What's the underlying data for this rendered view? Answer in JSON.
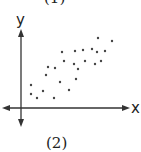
{
  "labels": {
    "top": "(1)",
    "bottom": "(2)"
  },
  "chart_data": {
    "type": "scatter",
    "title": "",
    "xlabel": "x",
    "ylabel": "y",
    "grid": false,
    "legend": null,
    "trend": "positive correlation",
    "points_px": [
      [
        98,
        38
      ],
      [
        112,
        41
      ],
      [
        62,
        52
      ],
      [
        75,
        51
      ],
      [
        83,
        50
      ],
      [
        92,
        49
      ],
      [
        97,
        52
      ],
      [
        105,
        51
      ],
      [
        64,
        61
      ],
      [
        74,
        64
      ],
      [
        78,
        69
      ],
      [
        85,
        61
      ],
      [
        95,
        64
      ],
      [
        101,
        61
      ],
      [
        48,
        67
      ],
      [
        55,
        68
      ],
      [
        46,
        75
      ],
      [
        60,
        82
      ],
      [
        76,
        79
      ],
      [
        31,
        85
      ],
      [
        43,
        91
      ],
      [
        69,
        90
      ],
      [
        31,
        94
      ],
      [
        37,
        98
      ],
      [
        54,
        98
      ]
    ]
  },
  "colors": {
    "axis": "#333333",
    "point": "#444444"
  }
}
